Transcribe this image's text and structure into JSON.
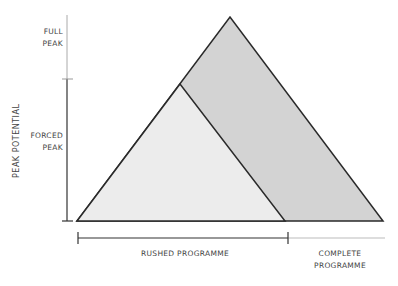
{
  "diagram": {
    "y_axis_label": "PEAK POTENTIAL",
    "levels": [
      {
        "id": "full",
        "line1": "FULL",
        "line2": "PEAK"
      },
      {
        "id": "forced",
        "line1": "FORCED",
        "line2": "PEAK"
      }
    ],
    "timeline": [
      {
        "id": "rushed",
        "label": "RUSHED PROGRAMME"
      },
      {
        "id": "complete",
        "line1": "COMPLETE",
        "line2": "PROGRAMME"
      }
    ],
    "shapes": [
      {
        "id": "complete-triangle",
        "fill": "#d3d3d3"
      },
      {
        "id": "rushed-triangle",
        "fill": "#ececec"
      }
    ]
  }
}
